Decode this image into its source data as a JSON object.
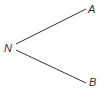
{
  "diagram": {
    "type": "angle",
    "vertex": {
      "label": "N",
      "x": 16,
      "y": 47
    },
    "rays": [
      {
        "label": "A",
        "end_x": 86,
        "end_y": 9
      },
      {
        "label": "B",
        "end_x": 86,
        "end_y": 83
      }
    ],
    "line_color": "#333333",
    "label_color": "#333333"
  }
}
